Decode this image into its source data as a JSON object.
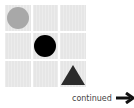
{
  "grid": {
    "rows": 3,
    "cols": 3,
    "cell_color": "#e6e6e6",
    "shapes": [
      {
        "row": 0,
        "col": 0,
        "type": "circle",
        "color": "#a8a8a8"
      },
      {
        "row": 1,
        "col": 1,
        "type": "circle",
        "color": "#000000"
      },
      {
        "row": 2,
        "col": 2,
        "type": "triangle",
        "color": "#2b2b2b"
      }
    ]
  },
  "footer": {
    "label": "continued",
    "icon": "arrow-right-icon"
  }
}
